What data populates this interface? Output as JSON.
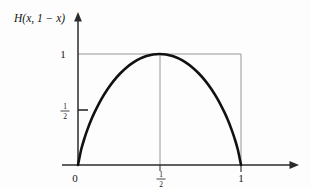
{
  "figure": {
    "caption_label": "H(x, 1 − x)",
    "background_color": "#fdfdfd",
    "curve_color": "#111111",
    "axis_color": "#2b2b2b",
    "guide_color": "#8c8c8c"
  },
  "axis": {
    "y_label": "H(x, 1 − x)",
    "y_ticks": [
      {
        "value": 1,
        "label": "1",
        "is_fraction": false
      },
      {
        "value": 0.5,
        "label": "1/2",
        "is_fraction": true,
        "numerator": "1",
        "denominator": "2"
      }
    ],
    "x_ticks": [
      {
        "value": 0,
        "label": "0",
        "is_fraction": false
      },
      {
        "value": 0.5,
        "label": "1/2",
        "is_fraction": true,
        "numerator": "1",
        "denominator": "2"
      },
      {
        "value": 1,
        "label": "1",
        "is_fraction": false
      }
    ]
  },
  "chart_data": {
    "type": "line",
    "title": "",
    "subtitle": "",
    "xlabel": "",
    "ylabel": "H(x, 1 − x)",
    "xlim": [
      0,
      1.18
    ],
    "ylim": [
      0,
      1.18
    ],
    "grid": false,
    "legend": "none",
    "annotations": [
      {
        "text": "1",
        "kind": "y-tick",
        "x": 0,
        "y": 1
      },
      {
        "text": "1/2",
        "kind": "y-tick",
        "x": 0,
        "y": 0.5
      },
      {
        "text": "0",
        "kind": "x-tick",
        "x": 0,
        "y": 0
      },
      {
        "text": "1/2",
        "kind": "x-tick",
        "x": 0.5,
        "y": 0
      },
      {
        "text": "1",
        "kind": "x-tick",
        "x": 1,
        "y": 0
      }
    ],
    "guide_lines": [
      {
        "name": "horizontal-at-one",
        "from": [
          0,
          1
        ],
        "to": [
          1,
          1
        ]
      },
      {
        "name": "vertical-at-half",
        "from": [
          0.5,
          0
        ],
        "to": [
          0.5,
          1
        ]
      },
      {
        "name": "vertical-at-one",
        "from": [
          1,
          0
        ],
        "to": [
          1,
          1
        ]
      }
    ],
    "series": [
      {
        "name": "H(x, 1-x)",
        "x": [
          0,
          0.02,
          0.04,
          0.06,
          0.08,
          0.1,
          0.14,
          0.18,
          0.22,
          0.26,
          0.3,
          0.34,
          0.38,
          0.42,
          0.46,
          0.5,
          0.54,
          0.58,
          0.62,
          0.66,
          0.7,
          0.74,
          0.78,
          0.82,
          0.86,
          0.9,
          0.92,
          0.94,
          0.96,
          0.98,
          1
        ],
        "values": [
          0,
          0.1414,
          0.2423,
          0.3274,
          0.4022,
          0.469,
          0.5842,
          0.6801,
          0.7602,
          0.8267,
          0.8813,
          0.9249,
          0.9581,
          0.9815,
          0.9954,
          1,
          0.9954,
          0.9815,
          0.9581,
          0.9249,
          0.8813,
          0.8267,
          0.7602,
          0.6801,
          0.5842,
          0.469,
          0.4022,
          0.3274,
          0.2423,
          0.1414,
          0
        ]
      }
    ]
  }
}
